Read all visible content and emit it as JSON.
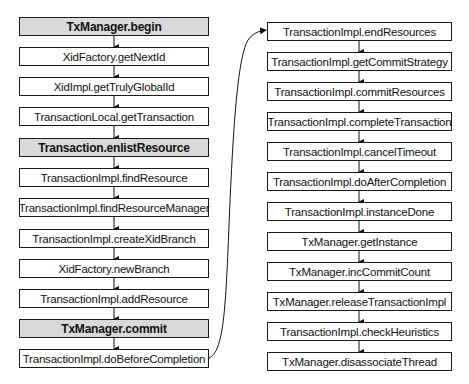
{
  "diagram": {
    "left_column": [
      {
        "label": "TxManager.begin",
        "highlight": true
      },
      {
        "label": "XidFactory.getNextId",
        "highlight": false
      },
      {
        "label": "XidImpl.getTrulyGlobalId",
        "highlight": false
      },
      {
        "label": "TransactionLocal.getTransaction",
        "highlight": false
      },
      {
        "label": "Transaction.enlistResource",
        "highlight": true
      },
      {
        "label": "TransactionImpl.findResource",
        "highlight": false
      },
      {
        "label": "TransactionImpl.findResourceManager",
        "highlight": false
      },
      {
        "label": "TransactionImpl.createXidBranch",
        "highlight": false
      },
      {
        "label": "XidFactory.newBranch",
        "highlight": false
      },
      {
        "label": "TransactionImpl.addResource",
        "highlight": false
      },
      {
        "label": "TxManager.commit",
        "highlight": true
      },
      {
        "label": "TransactionImpl.doBeforeCompletion",
        "highlight": false
      }
    ],
    "right_column": [
      {
        "label": "TransactionImpl.endResources"
      },
      {
        "label": "TransactionImpl.getCommitStrategy"
      },
      {
        "label": "TransactionImpl.commitResources"
      },
      {
        "label": "TransactionImpl.completeTransaction"
      },
      {
        "label": "TransactionImpl.cancelTimeout"
      },
      {
        "label": "TransactionImpl.doAfterCompletion"
      },
      {
        "label": "TransactionImpl.instanceDone"
      },
      {
        "label": "TxManager.getInstance"
      },
      {
        "label": "TxManager.incCommitCount"
      },
      {
        "label": "TxManager.releaseTransactionImpl"
      },
      {
        "label": "TransactionImpl.checkHeuristics"
      },
      {
        "label": "TxManager.disassociateThread"
      }
    ],
    "colors": {
      "highlight_fill": "#d9d9d9",
      "border": "#1a1a1a"
    }
  }
}
